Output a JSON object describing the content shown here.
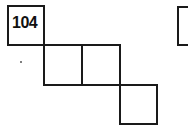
{
  "puzzle": {
    "clue_number": "104",
    "cells": [
      {
        "id": "c1",
        "label": "104"
      },
      {
        "id": "c2",
        "label": ""
      },
      {
        "id": "c3",
        "label": ""
      },
      {
        "id": "c4",
        "label": ""
      },
      {
        "id": "c5",
        "label": ""
      }
    ],
    "colors": {
      "line": "#1a1a1a",
      "background": "#ffffff"
    }
  }
}
